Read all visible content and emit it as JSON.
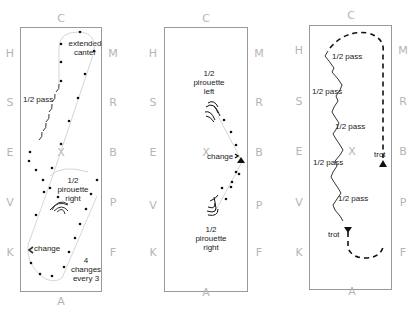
{
  "diagrams": [
    {
      "id": "left",
      "letters": {
        "top": "C",
        "bottom": "A",
        "left": [
          "H",
          "S",
          "E",
          "V",
          "K"
        ],
        "right": [
          "M",
          "R",
          "B",
          "P",
          "F"
        ]
      },
      "labels": [
        "extended canter",
        "1/2 pass",
        "1/2 pirouette right",
        "change",
        "4 changes every 3"
      ]
    },
    {
      "id": "middle",
      "letters": {
        "top": "C",
        "bottom": "A",
        "left": [
          "H",
          "S",
          "E",
          "V",
          "K"
        ],
        "right": [
          "M",
          "R",
          "B",
          "P",
          "F"
        ]
      },
      "labels": [
        "1/2 pirouette left",
        "change",
        "1/2 pirouette right"
      ]
    },
    {
      "id": "right",
      "letters": {
        "top": "C",
        "bottom": "A",
        "left": [
          "H",
          "S",
          "E",
          "V",
          "K"
        ],
        "right": [
          "M",
          "R",
          "B",
          "P",
          "F"
        ]
      },
      "labels": [
        "1/2 pass",
        "1/2 pass",
        "1/2 pass",
        "1/2 pass",
        "1/2 pass",
        "trot",
        "trot"
      ]
    }
  ],
  "center_marker": "X",
  "colors": {
    "letters": "#b5b5b5",
    "border": "#9a9a9a",
    "ink": "#222222",
    "path": "#cccccc"
  }
}
